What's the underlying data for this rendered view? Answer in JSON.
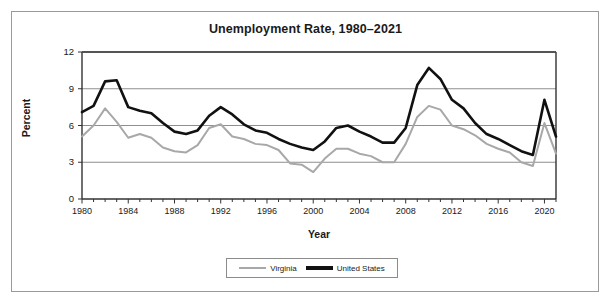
{
  "chart_data": {
    "type": "line",
    "title": "Unemployment Rate, 1980–2021",
    "xlabel": "Year",
    "ylabel": "Percent",
    "ylim": [
      0,
      12
    ],
    "xlim": [
      1980,
      2021
    ],
    "yticks": [
      0,
      3,
      6,
      9,
      12
    ],
    "xticks": [
      1980,
      1984,
      1988,
      1992,
      1996,
      2000,
      2004,
      2008,
      2012,
      2016,
      2020
    ],
    "grid": "horizontal",
    "legend_position": "bottom",
    "x": [
      1980,
      1981,
      1982,
      1983,
      1984,
      1985,
      1986,
      1987,
      1988,
      1989,
      1990,
      1991,
      1992,
      1993,
      1994,
      1995,
      1996,
      1997,
      1998,
      1999,
      2000,
      2001,
      2002,
      2003,
      2004,
      2005,
      2006,
      2007,
      2008,
      2009,
      2010,
      2011,
      2012,
      2013,
      2014,
      2015,
      2016,
      2017,
      2018,
      2019,
      2020,
      2021
    ],
    "series": [
      {
        "name": "Virginia",
        "color": "#a8a8a8",
        "values": [
          5.1,
          6.0,
          7.4,
          6.3,
          5.0,
          5.3,
          5.0,
          4.2,
          3.9,
          3.8,
          4.4,
          5.8,
          6.1,
          5.1,
          4.9,
          4.5,
          4.4,
          4.0,
          2.9,
          2.8,
          2.2,
          3.3,
          4.1,
          4.1,
          3.7,
          3.5,
          3.0,
          3.0,
          4.5,
          6.7,
          7.6,
          7.3,
          6.0,
          5.7,
          5.2,
          4.5,
          4.1,
          3.8,
          3.0,
          2.7,
          6.2,
          3.7
        ]
      },
      {
        "name": "United States",
        "color": "#111111",
        "values": [
          7.1,
          7.6,
          9.6,
          9.7,
          7.5,
          7.2,
          7.0,
          6.2,
          5.5,
          5.3,
          5.6,
          6.8,
          7.5,
          6.9,
          6.1,
          5.6,
          5.4,
          4.9,
          4.5,
          4.2,
          4.0,
          4.7,
          5.8,
          6.0,
          5.5,
          5.1,
          4.6,
          4.6,
          5.8,
          9.3,
          10.7,
          9.8,
          8.1,
          7.4,
          6.2,
          5.3,
          4.9,
          4.4,
          3.9,
          3.6,
          8.1,
          5.1
        ]
      }
    ]
  },
  "legend": {
    "items": [
      {
        "label": "Virginia"
      },
      {
        "label": "United States"
      }
    ]
  }
}
